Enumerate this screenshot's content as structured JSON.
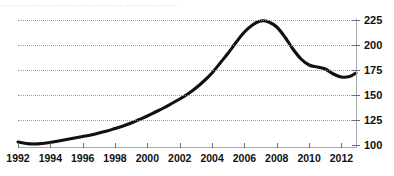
{
  "caption": {
    "text": "— —— —— — ——— —— ——— — ———— ———"
  },
  "chart_data": {
    "type": "line",
    "title": "",
    "subtitle": "",
    "xlabel": "",
    "ylabel": "",
    "xlim": [
      1992,
      2012.9
    ],
    "ylim": [
      100,
      225
    ],
    "grid": true,
    "grid_axis": "y",
    "legend": false,
    "legend_position": "none",
    "line_color": "#111111",
    "grid_color": "#8d8d93",
    "axis_color": "#a8a8ad",
    "y_ticks": [
      100,
      125,
      150,
      175,
      200,
      225
    ],
    "y_tick_labels": [
      "100",
      "125",
      "150",
      "175",
      "200",
      "225"
    ],
    "y_axis_side": "right",
    "x_ticks": [
      1992,
      1994,
      1996,
      1998,
      2000,
      2002,
      2004,
      2006,
      2008,
      2010,
      2012
    ],
    "x_tick_labels": [
      "1992",
      "1994",
      "1996",
      "1998",
      "2000",
      "2002",
      "2004",
      "2006",
      "2008",
      "2010",
      "2012"
    ],
    "series": [
      {
        "name": "index",
        "x": [
          1992,
          1992.5,
          1993,
          1993.5,
          1994,
          1994.5,
          1995,
          1995.5,
          1996,
          1996.5,
          1997,
          1997.5,
          1998,
          1998.5,
          1999,
          1999.5,
          2000,
          2000.5,
          2001,
          2001.5,
          2002,
          2002.5,
          2003,
          2003.5,
          2004,
          2004.5,
          2005,
          2005.5,
          2006,
          2006.5,
          2007,
          2007.5,
          2008,
          2008.5,
          2009,
          2009.5,
          2010,
          2010.5,
          2011,
          2011.5,
          2012,
          2012.5,
          2012.9
        ],
        "values": [
          103,
          101.5,
          101,
          101.5,
          102.5,
          104,
          105.5,
          107,
          108.5,
          110,
          112,
          114,
          116.5,
          119,
          122,
          125.5,
          129,
          133,
          137,
          141.5,
          146,
          151,
          157,
          164,
          172,
          182,
          192,
          203,
          213,
          220,
          224,
          223,
          218,
          208,
          196,
          186,
          180,
          178,
          176,
          171,
          168,
          168.5,
          172
        ]
      }
    ]
  }
}
